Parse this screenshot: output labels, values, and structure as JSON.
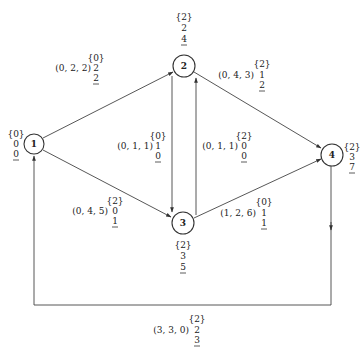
{
  "nodes": [
    {
      "id": "1",
      "label": "1",
      "x": 34,
      "y": 144,
      "set": "{0}",
      "v1": "0",
      "v2": "0"
    },
    {
      "id": "2",
      "label": "2",
      "x": 184,
      "y": 66,
      "set": "{2}",
      "v1": "2",
      "v2": "4"
    },
    {
      "id": "3",
      "label": "3",
      "x": 183,
      "y": 223,
      "set": "{2}",
      "v1": "3",
      "v2": "5"
    },
    {
      "id": "4",
      "label": "4",
      "x": 332,
      "y": 155,
      "set": "{2}",
      "v1": "3",
      "v2": "7"
    }
  ],
  "edges": [
    {
      "from": "1",
      "to": "2",
      "triple": "(0, 2, 2)",
      "set": "{0}",
      "v1": "2",
      "v2": "2"
    },
    {
      "from": "1",
      "to": "3",
      "triple": "(0, 4, 5)",
      "set": "{2}",
      "v1": "0",
      "v2": "1"
    },
    {
      "from": "2",
      "to": "3",
      "triple": "(0, 1, 1)",
      "set": "{0}",
      "v1": "1",
      "v2": "0"
    },
    {
      "from": "3",
      "to": "2",
      "triple": "(0, 1, 1)",
      "set": "{2}",
      "v1": "0",
      "v2": "0"
    },
    {
      "from": "2",
      "to": "4",
      "triple": "(0, 4, 3)",
      "set": "{2}",
      "v1": "1",
      "v2": "2"
    },
    {
      "from": "3",
      "to": "4",
      "triple": "(1, 2, 6)",
      "set": "{0}",
      "v1": "1",
      "v2": "1"
    },
    {
      "from": "4",
      "to": "1",
      "triple": "(3, 3, 0)",
      "set": "{2}",
      "v1": "2",
      "v2": "3"
    }
  ]
}
